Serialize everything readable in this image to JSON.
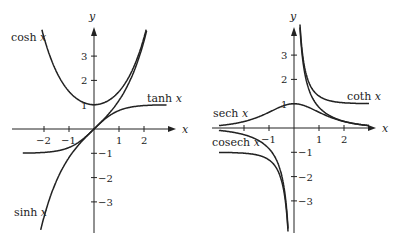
{
  "chart_data": [
    {
      "type": "line",
      "title": "",
      "xlabel": "x",
      "ylabel": "y",
      "xlim": [
        -2.8,
        3.0
      ],
      "ylim": [
        -3.9,
        4.3
      ],
      "x_ticks": [
        -2,
        -1,
        1,
        2
      ],
      "x_tick_labels": [
        "−2",
        "−1",
        "1",
        "2"
      ],
      "y_ticks": [
        3,
        2,
        1,
        -1,
        -2,
        -3
      ],
      "y_tick_labels": [
        "3",
        "2",
        "1",
        "−1",
        "−2",
        "−3"
      ],
      "grid": false,
      "series": [
        {
          "name": "cosh x",
          "label": "cosh",
          "function": "cosh"
        },
        {
          "name": "sinh x",
          "label": "sinh",
          "function": "sinh"
        },
        {
          "name": "tanh x",
          "label": "tanh",
          "function": "tanh"
        }
      ]
    },
    {
      "type": "line",
      "title": "",
      "xlabel": "x",
      "ylabel": "y",
      "xlim": [
        -3.0,
        3.0
      ],
      "ylim": [
        -3.9,
        4.3
      ],
      "x_ticks": [
        -2,
        -1,
        1,
        2
      ],
      "x_tick_labels": [
        "",
        "−1",
        "1",
        "2"
      ],
      "y_ticks": [
        3,
        2,
        1,
        -1,
        -2,
        -3
      ],
      "y_tick_labels": [
        "3",
        "2",
        "1",
        "−1",
        "−2",
        "−3"
      ],
      "grid": false,
      "series": [
        {
          "name": "sech x",
          "label": "sech",
          "function": "sech"
        },
        {
          "name": "cosech x",
          "label": "cosech",
          "function": "csch"
        },
        {
          "name": "coth x",
          "label": "coth",
          "function": "coth"
        }
      ]
    }
  ],
  "axis_labels": {
    "x": "x",
    "y": "y"
  },
  "left_plot": {
    "labels": {
      "cosh": "cosh",
      "sinh": "sinh",
      "tanh": "tanh"
    }
  },
  "right_plot": {
    "labels": {
      "sech": "sech",
      "cosech": "cosech",
      "coth": "coth"
    }
  }
}
